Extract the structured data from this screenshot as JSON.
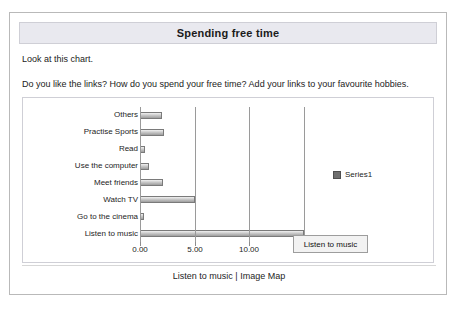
{
  "window": {
    "title": "Spending free time"
  },
  "intro": {
    "line1": "Look at this chart.",
    "line2": "Do you like the links? How do you spend your free time? Add your links to your favourite hobbies."
  },
  "legend": {
    "series_label": "Series1",
    "swatch_color": "#6f6f6f"
  },
  "tooltip": {
    "text": "Listen to music"
  },
  "status": {
    "text": "Listen to music | Image Map"
  },
  "chart_data": {
    "type": "bar",
    "orientation": "horizontal",
    "title": "Spending free time",
    "xlabel": "",
    "ylabel": "",
    "categories": [
      "Others",
      "Practise Sports",
      "Read",
      "Use the computer",
      "Meet friends",
      "Watch TV",
      "Go to the cinema",
      "Listen to music"
    ],
    "series": [
      {
        "name": "Series1",
        "values": [
          2.0,
          2.2,
          0.5,
          0.8,
          2.1,
          5.0,
          0.4,
          15.0
        ]
      }
    ],
    "xlim": [
      0,
      15
    ],
    "xticks": [
      0.0,
      5.0,
      10.0,
      15.0
    ],
    "xtick_labels": [
      "0.00",
      "5.00",
      "10.00",
      "15.00"
    ],
    "grid": true,
    "legend_position": "right"
  }
}
